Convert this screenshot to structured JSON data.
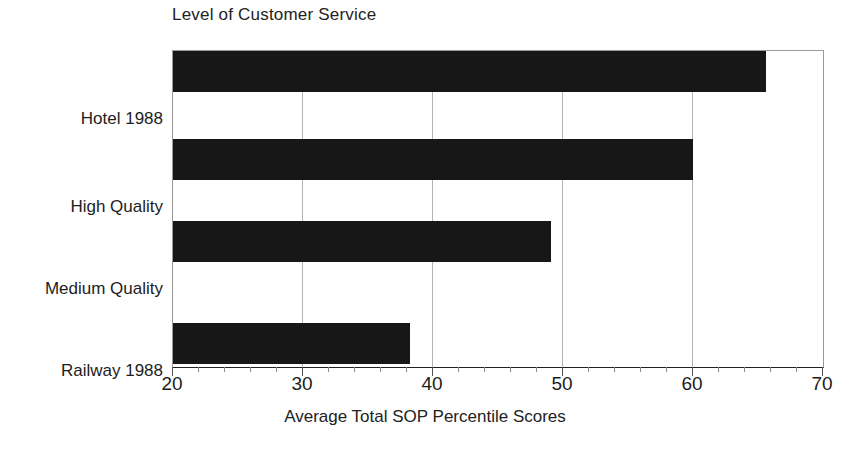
{
  "chart_data": {
    "type": "bar",
    "orientation": "horizontal",
    "title": "Level of Customer Service",
    "xlabel": "Average Total SOP Percentile Scores",
    "ylabel": "",
    "categories": [
      "Hotel 1988",
      "High Quality",
      "Medium Quality",
      "Railway 1988"
    ],
    "values": [
      65.6,
      60.0,
      49.1,
      38.2
    ],
    "series": [
      {
        "name": "Average Total SOP Percentile Scores",
        "values": [
          65.6,
          60.0,
          49.1,
          38.2
        ],
        "color": "#171717"
      }
    ],
    "xlim": [
      20,
      70
    ],
    "xticks": [
      20,
      30,
      40,
      50,
      60,
      70
    ],
    "xtick_labels": [
      "20",
      "30",
      "40",
      "50",
      "60",
      "70"
    ],
    "minor_tick_step": 2,
    "gridlines": [
      30,
      40,
      50,
      60
    ],
    "grid": true,
    "legend": false,
    "legend_position": "none",
    "bar_color": "#171717",
    "axis_color": "#9a9a9a",
    "grid_color": "#b4b4b4"
  }
}
